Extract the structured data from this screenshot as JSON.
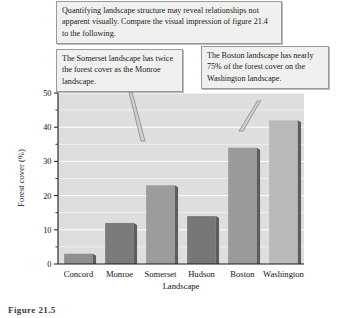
{
  "figure": {
    "caption": "Figure 21.5"
  },
  "callouts": {
    "top": "Quantifying landscape structure may reveal relationships not apparent visually. Compare the visual impression of figure 21.4 to the following.",
    "somerset": "The Somerset landscape has twice the forest cover as the Monroe landscape.",
    "boston": "The Boston landscape has nearly 75% of the forest cover on the Washington landscape."
  },
  "chart_data": {
    "type": "bar",
    "title": "",
    "categories": [
      "Concord",
      "Monroe",
      "Somerset",
      "Hudson",
      "Boston",
      "Washington"
    ],
    "values": [
      3,
      12,
      23,
      14,
      34,
      42
    ],
    "xlabel": "Landscape",
    "ylabel": "Forest cover (%)",
    "ylim": [
      0,
      50
    ],
    "ytick_labels": [
      "0",
      "10",
      "20",
      "30",
      "40",
      "50"
    ],
    "ytick_values": [
      0,
      10,
      20,
      30,
      40,
      50
    ],
    "yminor_values": [
      5,
      15,
      25,
      35,
      45
    ],
    "grid": true,
    "legend": false,
    "colors": {
      "plot_background": "#dedede",
      "gridline": "#ffffff",
      "axis": "#1a1a1a",
      "bar_fill": [
        "#8e8e8e",
        "#7b7b7b",
        "#9c9c9c",
        "#777777",
        "#9a9a9a",
        "#b9b9b9"
      ],
      "bar_shadow": "#5d5d5d"
    }
  }
}
